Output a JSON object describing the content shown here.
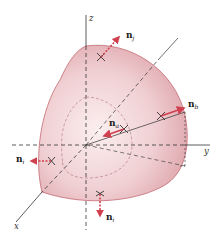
{
  "figure": {
    "axes": {
      "x": "x",
      "y": "y",
      "z": "z"
    },
    "normals": [
      {
        "id": "top",
        "base": "n",
        "subscript": "j"
      },
      {
        "id": "right",
        "base": "n",
        "subscript": "b"
      },
      {
        "id": "center",
        "base": "n",
        "subscript": "a"
      },
      {
        "id": "left",
        "base": "n",
        "subscript": "i"
      },
      {
        "id": "bottom",
        "base": "n",
        "subscript": "i"
      }
    ],
    "colors": {
      "surface_fill": "#e9bcc0",
      "surface_edge": "#c46a72",
      "arrow": "#d0404f",
      "axis": "#333333",
      "dashed": "#444444"
    }
  }
}
